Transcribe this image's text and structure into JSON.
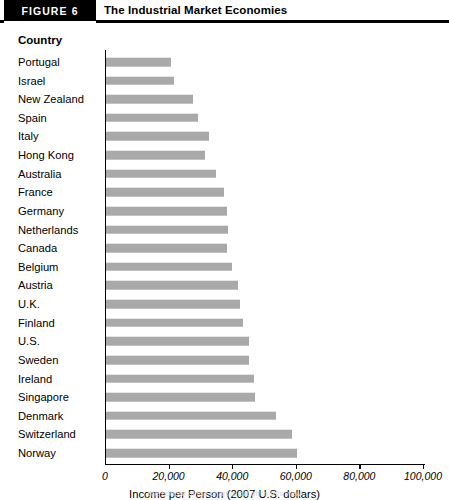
{
  "figure": {
    "tab_label": "FIGURE 6",
    "title": "The Industrial Market Economies"
  },
  "chart_area": {
    "category_header": "Country",
    "footnote": "the bottom of the chart is cut off in this view"
  },
  "chart_data": {
    "type": "bar",
    "orientation": "horizontal",
    "title": "The Industrial Market Economies",
    "xlabel": "Income per Person (2007 U.S. dollars)",
    "ylabel": "Country",
    "xlim": [
      0,
      100000
    ],
    "xticks": [
      0,
      20000,
      40000,
      60000,
      80000,
      100000
    ],
    "xtick_labels": [
      "0",
      "20,000",
      "40,000",
      "60,000",
      "80,000",
      "100,000"
    ],
    "grid": false,
    "legend": false,
    "bar_color": "#a9a9a9",
    "categories": [
      "Portugal",
      "Israel",
      "New Zealand",
      "Spain",
      "Italy",
      "Hong Kong",
      "Australia",
      "France",
      "Germany",
      "Netherlands",
      "Canada",
      "Belgium",
      "Austria",
      "U.K.",
      "Finland",
      "U.S.",
      "Sweden",
      "Ireland",
      "Singapore",
      "Denmark",
      "Switzerland",
      "Norway"
    ],
    "values": [
      20300,
      21500,
      27500,
      28800,
      32500,
      31000,
      34500,
      37000,
      38000,
      38500,
      38000,
      39500,
      41500,
      42000,
      43000,
      45000,
      45000,
      46500,
      47000,
      53500,
      58500,
      60000
    ]
  }
}
